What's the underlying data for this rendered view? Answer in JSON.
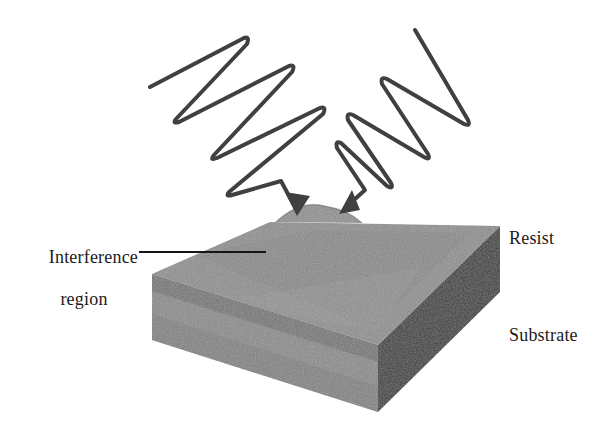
{
  "figure": {
    "background_color": "#ffffff",
    "ink_color": "#3a3a3a",
    "text_color": "#1a1a1a"
  },
  "labels": {
    "interference_line1": "Interference",
    "interference_line2": "region",
    "resist": "Resist",
    "substrate": "Substrate"
  },
  "slab": {
    "top_face_color": "#8e8e8e",
    "top_band_color": "#7c7c7c",
    "front_face_color": "#8a8a8a",
    "front_band_color": "#6f6f6f",
    "right_face_color": "#3d3d3d",
    "bump_color": "#909090"
  },
  "waves": {
    "left_beam_color": "#3f3f3f",
    "right_beam_color": "#3f3f3f",
    "stroke_width": 4,
    "left_beam_name": "incident-beam-left",
    "right_beam_name": "incident-beam-right"
  },
  "icons": {
    "arrow_left": "arrow-down-right-icon",
    "arrow_right": "arrow-down-left-icon",
    "leader": "leader-line-icon"
  }
}
